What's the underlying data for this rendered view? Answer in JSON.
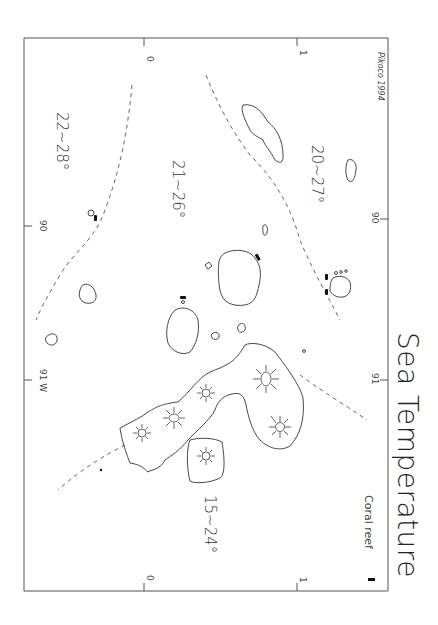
{
  "map": {
    "title": "Sea Temperature",
    "signature": "Pikoco 1994",
    "legend": {
      "symbol": "coral-reef-mark",
      "label": "Coral reef"
    },
    "zones": [
      {
        "id": "north-west",
        "label": "22~28°"
      },
      {
        "id": "central",
        "label": "21~26°"
      },
      {
        "id": "east",
        "label": "20~27°"
      },
      {
        "id": "south-west",
        "label": "15~24°"
      }
    ],
    "axis_labels": {
      "top": [
        "0",
        "1"
      ],
      "bottom": [
        "0",
        "1"
      ],
      "left": [
        "90",
        "91 W"
      ],
      "right": [
        "90",
        "91"
      ]
    }
  }
}
